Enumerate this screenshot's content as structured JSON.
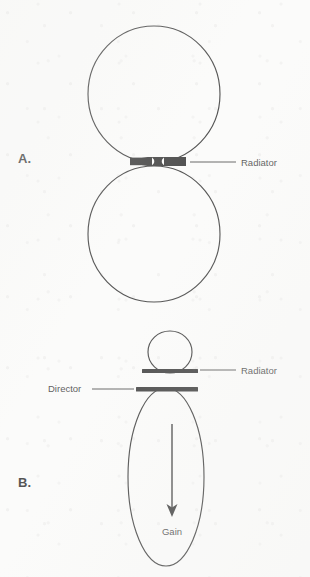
{
  "figure": {
    "background_color": "#fbfbfa",
    "line_color": "#0d0d0d",
    "panels": [
      {
        "id": "panel-a",
        "letter": "A.",
        "letter_x": 18,
        "letter_y": 163,
        "description": "Bidirectional (figure-eight / two-lobe) radiation pattern of a dipole radiator",
        "lobes": [
          {
            "name": "upper-lobe",
            "cx": 154,
            "cy": 94,
            "rx": 66,
            "ry": 68
          },
          {
            "name": "lower-lobe",
            "cx": 154,
            "cy": 234,
            "rx": 66,
            "ry": 68
          }
        ],
        "elements": [
          {
            "name": "radiator",
            "type": "bar",
            "label": "Radiator",
            "x": 130,
            "y": 157,
            "width": 56,
            "height": 9,
            "waist": 3.2,
            "label_x": 241,
            "label_y": 166,
            "leader_from_x": 190,
            "leader_to_x": 236,
            "leader_y": 162
          }
        ]
      },
      {
        "id": "panel-b",
        "letter": "B.",
        "letter_x": 18,
        "letter_y": 487,
        "description": "Unidirectional radiation pattern with a small back lobe, produced by adding a director; arrow shows direction of gain",
        "lobes": [
          {
            "name": "back-lobe",
            "cx": 170,
            "cy": 352,
            "rx": 22,
            "ry": 21
          },
          {
            "name": "main-lobe",
            "cx": 166,
            "cy": 477,
            "rx": 38,
            "ry": 89
          }
        ],
        "elements": [
          {
            "name": "radiator",
            "type": "bar",
            "label": "Radiator",
            "x": 142,
            "y": 369,
            "width": 56,
            "height": 4,
            "label_x": 241,
            "label_y": 374,
            "leader_from_x": 200,
            "leader_to_x": 236,
            "leader_y": 370
          },
          {
            "name": "director",
            "type": "bar",
            "label": "Director",
            "x": 136,
            "y": 387,
            "width": 62,
            "height": 4.5,
            "label_x": 48,
            "label_y": 392,
            "leader_from_x": 92,
            "leader_to_x": 134,
            "leader_y": 389
          },
          {
            "name": "gain-arrow",
            "type": "arrow",
            "label": "Gain",
            "x": 172,
            "y_start": 424,
            "y_end": 516,
            "label_x": 172,
            "label_y": 535
          }
        ]
      }
    ]
  }
}
